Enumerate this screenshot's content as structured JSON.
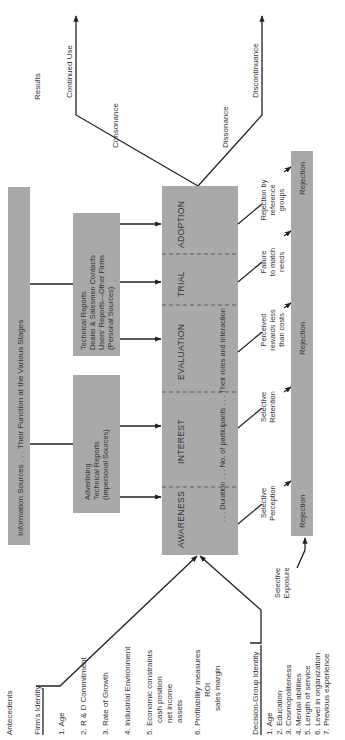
{
  "diagram": {
    "orientation": "rotated-90-ccw",
    "results": {
      "label": "Results",
      "continued_use": "Continued Use",
      "consonance": "Consonance",
      "dissonance": "Dissonance",
      "discontinuance": "Discontinuance"
    },
    "information_sources": {
      "title": "Information Sources . . . Their Function at the Various Stages",
      "impersonal": [
        "Advertising",
        "Technical Reports",
        "(Impersonal Sources)"
      ],
      "personal": [
        "Technical Reports",
        "Dealer & Salesmen Contacts",
        "Users' Reports—Other Firms",
        "(Personal Sources)"
      ]
    },
    "stages": {
      "items": [
        "AWARENESS",
        "INTEREST",
        "EVALUATION",
        "TRIAL",
        "ADOPTION"
      ],
      "caption": ". . . Duration . . . No. of participants . . . Their roles and interaction"
    },
    "rejection_reasons": [
      [
        "Selective",
        "Exposure"
      ],
      [
        "Selective",
        "Perception"
      ],
      [
        "Selective",
        "Retention"
      ],
      [
        "Perceived",
        "rewards less",
        "than costs"
      ],
      [
        "Failure",
        "to match",
        "needs"
      ],
      [
        "Rejection by",
        "reference",
        "groups"
      ]
    ],
    "rejection_labels": [
      "Rejection",
      "Rejection",
      "Rejection"
    ],
    "antecedents": {
      "title": "Antecedents",
      "firm_identity": {
        "title": "Firm's Identity",
        "items": [
          [
            "1.  Age"
          ],
          [
            "2.  R & D Commitment"
          ],
          [
            "3.  Rate of Growth"
          ],
          [
            "4.  Industrial Environment"
          ],
          [
            "5.  Economic constraints",
            "cash position",
            "net income",
            "assets"
          ],
          [
            "6.  Profitability measures",
            "ROI",
            "sales margin"
          ]
        ]
      },
      "decision_group_identity": {
        "title": "Decision-Group Identity",
        "items": [
          "1.  Age",
          "2.  Education",
          "3.  Cosmopoliteness",
          "4.  Mental abilities",
          "5.  Length of service",
          "6.  Level in organization",
          "7.  Previous experience"
        ]
      }
    }
  }
}
